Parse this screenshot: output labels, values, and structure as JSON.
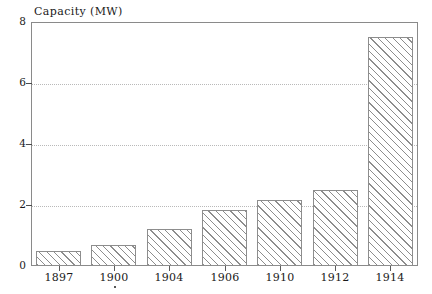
{
  "chart_data": {
    "type": "bar",
    "title": "Capacity (MW)",
    "xlabel": "",
    "ylabel": "Capacity (MW)",
    "categories": [
      "1897",
      "1900",
      "1904",
      "1906",
      "1910",
      "1912",
      "1914"
    ],
    "values": [
      0.5,
      0.7,
      1.2,
      1.85,
      2.15,
      2.5,
      7.5
    ],
    "ylim": [
      0,
      8
    ],
    "yticks": [
      0,
      2,
      4,
      6,
      8
    ],
    "ytick_labels": [
      "0",
      "2",
      "4",
      "6",
      "8"
    ],
    "grid": "horizontal-dotted",
    "legend": "none",
    "bar_fill": "diagonal-hatch",
    "colors": {
      "frame": "#8a8a8a",
      "hatch": "#8d8d8d",
      "grid": "#b9b9b9",
      "text": "#1a1a1a",
      "background": "#ffffff"
    }
  },
  "annotations": {
    "stray_mark": "."
  }
}
